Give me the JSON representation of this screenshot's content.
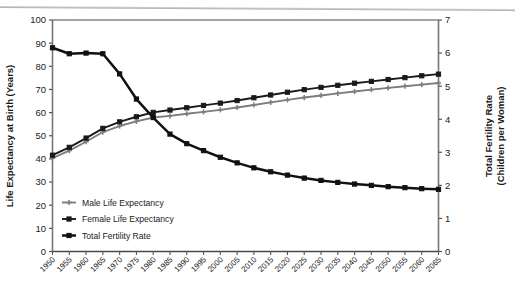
{
  "chart_data": {
    "type": "line",
    "title": "",
    "xlabel": "",
    "ylabel": "Life Expectancy at Birth (Years)",
    "y2label": "Total Fertility Rate (Children per Woman)",
    "ylim": [
      0,
      100
    ],
    "y2lim": [
      0,
      7
    ],
    "ytick_labels": [
      "100",
      "90",
      "80",
      "70",
      "60",
      "50",
      "40",
      "30",
      "20",
      "10",
      "0"
    ],
    "yticks": [
      100,
      90,
      80,
      70,
      60,
      50,
      40,
      30,
      20,
      10,
      0
    ],
    "y2tick_labels": [
      "7",
      "6",
      "5",
      "4",
      "3",
      "2",
      "1",
      "0"
    ],
    "y2ticks": [
      7,
      6,
      5,
      4,
      3,
      2,
      1,
      0
    ],
    "grid": false,
    "legend_position": "lower-left-inside",
    "x": [
      1950,
      1955,
      1960,
      1965,
      1970,
      1975,
      1980,
      1985,
      1990,
      1995,
      2000,
      2005,
      2010,
      2015,
      2020,
      2025,
      2030,
      2035,
      2040,
      2045,
      2050,
      2055,
      2060,
      2065
    ],
    "x_tick_labels": [
      "1950",
      "1955",
      "1960",
      "1965",
      "1970",
      "1975",
      "1980",
      "1985",
      "1990",
      "1995",
      "2000",
      "2005",
      "2010",
      "2015",
      "2020",
      "2025",
      "2030",
      "2035",
      "2040",
      "2045",
      "2050",
      "2055",
      "2060",
      "2065"
    ],
    "series": [
      {
        "name": "Male Life Expectancy",
        "axis": "left",
        "color": "#7d7d7d",
        "marker": "plus",
        "values": [
          40.3,
          43.6,
          47.4,
          51.6,
          54.2,
          56.2,
          57.9,
          58.6,
          59.5,
          60.3,
          61.2,
          62.2,
          63.3,
          64.4,
          65.5,
          66.5,
          67.4,
          68.3,
          69.1,
          69.9,
          70.7,
          71.4,
          72.1,
          72.8
        ]
      },
      {
        "name": "Female Life Expectancy",
        "axis": "left",
        "color": "#1a1a1a",
        "marker": "square",
        "values": [
          41.6,
          45.0,
          49.0,
          53.2,
          56.0,
          58.2,
          60.1,
          61.1,
          62.1,
          63.1,
          64.1,
          65.2,
          66.4,
          67.6,
          68.8,
          69.9,
          70.9,
          71.8,
          72.7,
          73.5,
          74.3,
          75.1,
          75.9,
          76.6
        ]
      },
      {
        "name": "Total Fertility Rate",
        "axis": "right",
        "color": "#111111",
        "marker": "square",
        "values": [
          6.16,
          5.98,
          6.0,
          5.98,
          5.37,
          4.61,
          4.05,
          3.55,
          3.26,
          3.05,
          2.85,
          2.68,
          2.53,
          2.41,
          2.31,
          2.22,
          2.15,
          2.09,
          2.04,
          2.0,
          1.96,
          1.93,
          1.9,
          1.88
        ]
      }
    ],
    "legend": [
      {
        "label": "Male Life Expectancy",
        "color": "#7d7d7d",
        "marker": "plus"
      },
      {
        "label": "Female Life Expectancy",
        "color": "#1a1a1a",
        "marker": "square"
      },
      {
        "label": "Total Fertility Rate",
        "color": "#111111",
        "marker": "square"
      }
    ]
  }
}
